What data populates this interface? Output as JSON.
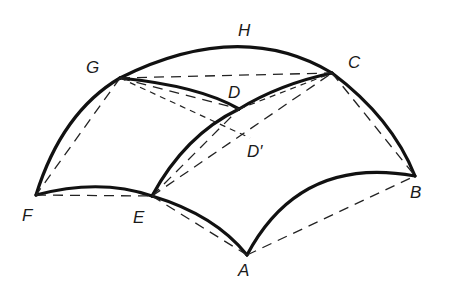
{
  "figure": {
    "colors": {
      "line": "#111111",
      "background": "#ffffff"
    },
    "points": {
      "A": {
        "label": "A",
        "x": 247,
        "y": 255
      },
      "B": {
        "label": "B",
        "x": 415,
        "y": 176
      },
      "C": {
        "label": "C",
        "x": 332,
        "y": 73
      },
      "D": {
        "label": "D",
        "x": 239,
        "y": 109
      },
      "D_prime": {
        "label": "D′",
        "x": 250,
        "y": 138
      },
      "E": {
        "label": "E",
        "x": 152,
        "y": 196
      },
      "F": {
        "label": "F",
        "x": 36,
        "y": 195
      },
      "G": {
        "label": "G",
        "x": 120,
        "y": 78
      },
      "H": {
        "label": "H",
        "x": 245,
        "y": 45
      }
    },
    "labels": {
      "A": "A",
      "B": "B",
      "C": "C",
      "D": "D",
      "D_prime": "D′",
      "E": "E",
      "F": "F",
      "G": "G",
      "H": "H"
    },
    "curved_edges": [
      "F-G",
      "G-H-C",
      "C-B",
      "F-E",
      "E-A",
      "A-B",
      "G-D",
      "D-C",
      "E-D"
    ],
    "dashed_chords": [
      "G-C",
      "C-B",
      "G-F",
      "F-E",
      "E-A",
      "A-B",
      "G-D",
      "E-D",
      "E-C",
      "G-D′"
    ]
  }
}
